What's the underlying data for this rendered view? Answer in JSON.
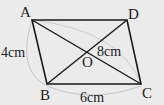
{
  "figure": {
    "type": "parallelogram",
    "vertices": {
      "A": "A",
      "B": "B",
      "C": "C",
      "D": "D"
    },
    "intersection": "O",
    "labels": {
      "side_AB": "4cm",
      "diagonal_BD_half": "8cm",
      "side_BC": "6cm"
    },
    "colors": {
      "line": "#1a1a1a",
      "arc": "#bdbdbd",
      "background": "#ebebeb"
    }
  }
}
